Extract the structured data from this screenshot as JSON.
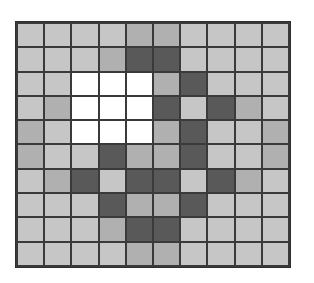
{
  "figure": {
    "type": "pixel-grid",
    "rows": 10,
    "columns": 10,
    "background_color": "#ffffff",
    "gridline_color": "#3a3a3a",
    "border_color": "#2f2f2f",
    "legend": [
      {
        "key": "L",
        "name": "light-gray-cell",
        "color": "#c6c6c6"
      },
      {
        "key": "M",
        "name": "medium-gray-cell",
        "color": "#b0b0b0"
      },
      {
        "key": "D",
        "name": "dark-gray-cell",
        "color": "#595959"
      },
      {
        "key": "W",
        "name": "white-cell",
        "color": "#ffffff"
      }
    ],
    "cells": [
      [
        "L",
        "L",
        "L",
        "L",
        "M",
        "M",
        "L",
        "L",
        "L",
        "L"
      ],
      [
        "L",
        "L",
        "L",
        "M",
        "D",
        "D",
        "L",
        "L",
        "L",
        "L"
      ],
      [
        "L",
        "L",
        "W",
        "W",
        "W",
        "M",
        "D",
        "L",
        "L",
        "L"
      ],
      [
        "L",
        "M",
        "W",
        "W",
        "W",
        "D",
        "L",
        "D",
        "M",
        "L"
      ],
      [
        "M",
        "L",
        "W",
        "W",
        "W",
        "M",
        "D",
        "L",
        "L",
        "M"
      ],
      [
        "M",
        "L",
        "L",
        "D",
        "M",
        "M",
        "D",
        "L",
        "L",
        "M"
      ],
      [
        "L",
        "M",
        "D",
        "L",
        "D",
        "D",
        "L",
        "D",
        "M",
        "L"
      ],
      [
        "L",
        "L",
        "L",
        "D",
        "M",
        "M",
        "D",
        "L",
        "L",
        "L"
      ],
      [
        "L",
        "L",
        "L",
        "M",
        "D",
        "D",
        "L",
        "L",
        "L",
        "L"
      ],
      [
        "L",
        "L",
        "L",
        "L",
        "M",
        "M",
        "L",
        "L",
        "L",
        "L"
      ]
    ]
  }
}
